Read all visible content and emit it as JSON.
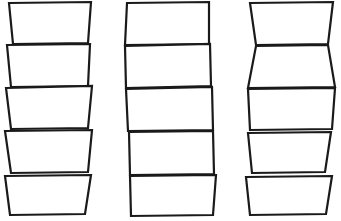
{
  "figure": {
    "type": "line-drawing",
    "width": 341,
    "height": 221,
    "background_color": "#ffffff",
    "stroke_color": "#1a1a1a",
    "fill_color": "#ffffff",
    "stack_count": 3,
    "boxes_per_stack": 5,
    "stacks": [
      {
        "name": "left-stack",
        "description": "Five trapezoids, each wider at the top than the bottom, tapering downward",
        "boxes": [
          {
            "name": "left-box-1",
            "stroke_width": 2.2,
            "points": "9,3 91,2 88,43 13,44"
          },
          {
            "name": "left-box-2",
            "stroke_width": 2.2,
            "points": "7,45 90,44 88,86 11,87"
          },
          {
            "name": "left-box-3",
            "stroke_width": 2.2,
            "points": "6,88 92,86 88,128 11,129"
          },
          {
            "name": "left-box-4",
            "stroke_width": 2.2,
            "points": "5,131 92,130 88,172 11,173"
          },
          {
            "name": "left-box-5",
            "stroke_width": 2.2,
            "points": "5,176 91,175 85,214 10,215"
          }
        ]
      },
      {
        "name": "middle-stack",
        "description": "Five near-rectangular boxes with slight tilts, stacked with nearly vertical sides",
        "boxes": [
          {
            "name": "middle-box-1",
            "stroke_width": 2.2,
            "points": "127,3 209,2 209,44 125,45"
          },
          {
            "name": "middle-box-2",
            "stroke_width": 2.2,
            "points": "125,46 210,44 211,86 126,88"
          },
          {
            "name": "middle-box-3",
            "stroke_width": 2.2,
            "points": "126,89 212,87 213,130 128,131"
          },
          {
            "name": "middle-box-4",
            "stroke_width": 2.2,
            "points": "129,132 213,131 214,174 130,175"
          },
          {
            "name": "middle-box-5",
            "stroke_width": 2.2,
            "points": "130,176 216,175 213,215 131,216"
          }
        ]
      },
      {
        "name": "right-stack",
        "description": "Five quadrilaterals that alternately taper and flare, producing a wavy outer silhouette",
        "boxes": [
          {
            "name": "right-box-1",
            "stroke_width": 2.2,
            "points": "250,3 333,2 328,44 256,45"
          },
          {
            "name": "right-box-2",
            "stroke_width": 2.2,
            "points": "256,46 328,45 335,87 248,88"
          },
          {
            "name": "right-box-3",
            "stroke_width": 2.2,
            "points": "248,89 335,88 332,129 250,130"
          },
          {
            "name": "right-box-4",
            "stroke_width": 2.2,
            "points": "248,133 331,132 325,172 252,173"
          },
          {
            "name": "right-box-5",
            "stroke_width": 2.2,
            "points": "246,177 332,176 326,214 250,215"
          }
        ]
      }
    ]
  }
}
